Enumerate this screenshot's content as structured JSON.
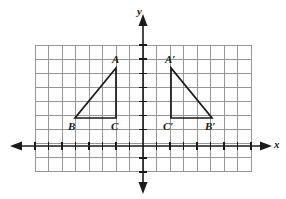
{
  "figure": {
    "background_color": "#ffffff",
    "grid_color": "#8c8c8c",
    "axis_color": "#1a1a1a",
    "shape_color": "#1a1a1a"
  },
  "axes": {
    "x_label": "x",
    "y_label": "y",
    "x_axis_y_px": 146,
    "y_axis_x_px": 143,
    "x_arrow_left": true,
    "x_arrow_right": true,
    "y_arrow_up": true,
    "y_arrow_down": true,
    "tick_count_x": 15,
    "tick_spacing_px": 13.5
  },
  "grid": {
    "left_px": 35,
    "top_px": 45,
    "right_px": 251,
    "bottom_px": 172,
    "cell_w_px": 13.5,
    "cell_h_px": 14.1,
    "cols": 16,
    "rows": 9
  },
  "chart_data": {
    "type": "scatter",
    "title": "",
    "xlabel": "x",
    "ylabel": "y",
    "grid": true,
    "legend": "none",
    "shapes": [
      {
        "name": "triangle-abc",
        "vertices": [
          {
            "label": "A",
            "x_px": 116,
            "y_px": 68,
            "x": -2,
            "y": 5.5
          },
          {
            "label": "B",
            "x_px": 75,
            "y_px": 118,
            "x": -5,
            "y": 2
          },
          {
            "label": "C",
            "x_px": 116,
            "y_px": 118,
            "x": -2,
            "y": 2
          }
        ]
      },
      {
        "name": "triangle-a-prime-b-prime-c-prime",
        "vertices": [
          {
            "label": "A'",
            "x_px": 171,
            "y_px": 68,
            "x": 2,
            "y": 5.5
          },
          {
            "label": "C'",
            "x_px": 171,
            "y_px": 118,
            "x": 2,
            "y": 2
          },
          {
            "label": "B'",
            "x_px": 212,
            "y_px": 118,
            "x": 5,
            "y": 2
          }
        ]
      }
    ]
  },
  "labels": {
    "A": {
      "text": "A",
      "left_px": 112,
      "top_px": 54
    },
    "B": {
      "text": "B",
      "left_px": 68,
      "top_px": 121
    },
    "C": {
      "text": "C",
      "left_px": 111,
      "top_px": 121
    },
    "Ap": {
      "text": "A′",
      "left_px": 165,
      "top_px": 54
    },
    "Cp": {
      "text": "C′",
      "left_px": 163,
      "top_px": 121
    },
    "Bp": {
      "text": "B′",
      "left_px": 205,
      "top_px": 121
    },
    "x": {
      "text": "x",
      "left_px": 274,
      "top_px": 139
    },
    "y": {
      "text": "y",
      "left_px": 137,
      "top_px": 6
    }
  }
}
